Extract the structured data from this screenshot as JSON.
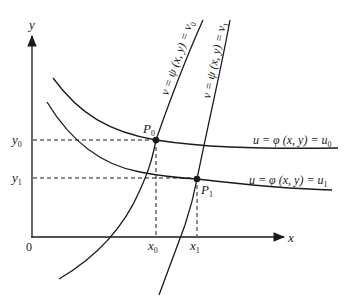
{
  "diagram": {
    "type": "level-curves-coordinate-transformation",
    "axes": {
      "x_label": "x",
      "y_label": "y",
      "origin_label": "0"
    },
    "ticks": {
      "x0": {
        "base": "x",
        "sub": "0"
      },
      "x1": {
        "base": "x",
        "sub": "1"
      },
      "y0": {
        "base": "y",
        "sub": "0"
      },
      "y1": {
        "base": "y",
        "sub": "1"
      }
    },
    "points": {
      "P0": {
        "base": "P",
        "sub": "0"
      },
      "P1": {
        "base": "P",
        "sub": "1"
      }
    },
    "curves": {
      "u0": {
        "text": "u = φ (x, y) = u",
        "sub": "0"
      },
      "u1": {
        "text": "u = φ (x, y) = u",
        "sub": "1"
      },
      "v0": {
        "text": "v = ψ (x, y) = v",
        "sub": "0"
      },
      "v1": {
        "text": "v = ψ (x, y) = v",
        "sub": "1"
      }
    },
    "colors": {
      "ink": "#1a1a1a",
      "background": "#ffffff"
    }
  }
}
